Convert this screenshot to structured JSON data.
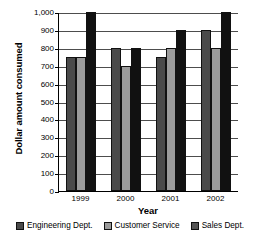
{
  "chart_data": {
    "type": "bar",
    "title": "",
    "xlabel": "Year",
    "ylabel": "Dollar amount consumed",
    "categories": [
      "1999",
      "2000",
      "2001",
      "2002"
    ],
    "series": [
      {
        "name": "Engineering Dept.",
        "color": "#4a4a4a",
        "values": [
          750,
          800,
          750,
          900
        ]
      },
      {
        "name": "Customer Service",
        "color": "#9b9b9b",
        "values": [
          750,
          700,
          800,
          800
        ]
      },
      {
        "name": "Sales Dept.",
        "color": "#111111",
        "values": [
          1000,
          800,
          900,
          1000
        ]
      }
    ],
    "ylim": [
      0,
      1000
    ],
    "ytick_step": 100,
    "ytick_labels": [
      "0",
      "100",
      "200",
      "300",
      "400",
      "500",
      "600",
      "700",
      "800",
      "900",
      "1,000"
    ],
    "grid": true,
    "legend_position": "bottom"
  },
  "legend": {
    "items": [
      {
        "label": "Engineering Dept.",
        "color": "#4a4a4a"
      },
      {
        "label": "Customer Service",
        "color": "#9b9b9b"
      },
      {
        "label": "Sales Dept.",
        "color": "#555555"
      }
    ]
  }
}
